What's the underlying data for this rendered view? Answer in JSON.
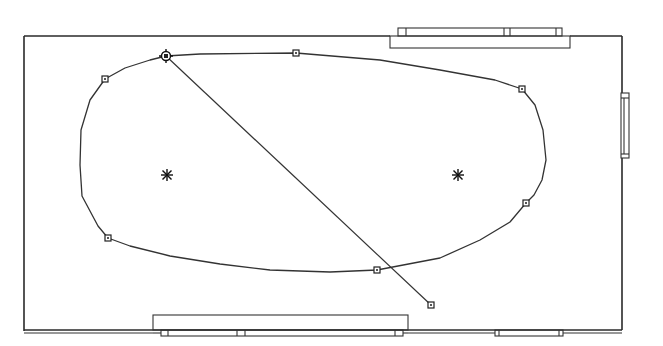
{
  "diagram": {
    "type": "floor-plan-with-spline",
    "colors": {
      "line": "#2a2a2a",
      "background": "#ffffff",
      "control_point_fill": "#555555"
    },
    "room": {
      "x": 24,
      "y": 35,
      "width": 598,
      "height": 295
    },
    "openings": [
      {
        "name": "top-window",
        "wall": "top",
        "x1": 390,
        "x2": 570
      },
      {
        "name": "right-window",
        "wall": "right",
        "y1": 93,
        "y2": 158
      },
      {
        "name": "bottom-left-window",
        "wall": "bottom",
        "x1": 153,
        "x2": 408
      },
      {
        "name": "bottom-right-window",
        "wall": "bottom",
        "x1": 495,
        "x2": 563
      }
    ],
    "spline": {
      "closed": true,
      "control_points": [
        {
          "id": "p1",
          "x": 166,
          "y": 56,
          "selected": true
        },
        {
          "id": "p2",
          "x": 296,
          "y": 53
        },
        {
          "id": "p3",
          "x": 522,
          "y": 89
        },
        {
          "id": "p4",
          "x": 526,
          "y": 203
        },
        {
          "id": "p5",
          "x": 377,
          "y": 270
        },
        {
          "id": "p6",
          "x": 108,
          "y": 238
        },
        {
          "id": "p7",
          "x": 105,
          "y": 79
        }
      ]
    },
    "foci": [
      {
        "id": "f1",
        "x": 167,
        "y": 175
      },
      {
        "id": "f2",
        "x": 458,
        "y": 175
      }
    ],
    "guide_line": {
      "from": {
        "x": 166,
        "y": 56
      },
      "to": {
        "x": 431,
        "y": 305
      }
    }
  }
}
